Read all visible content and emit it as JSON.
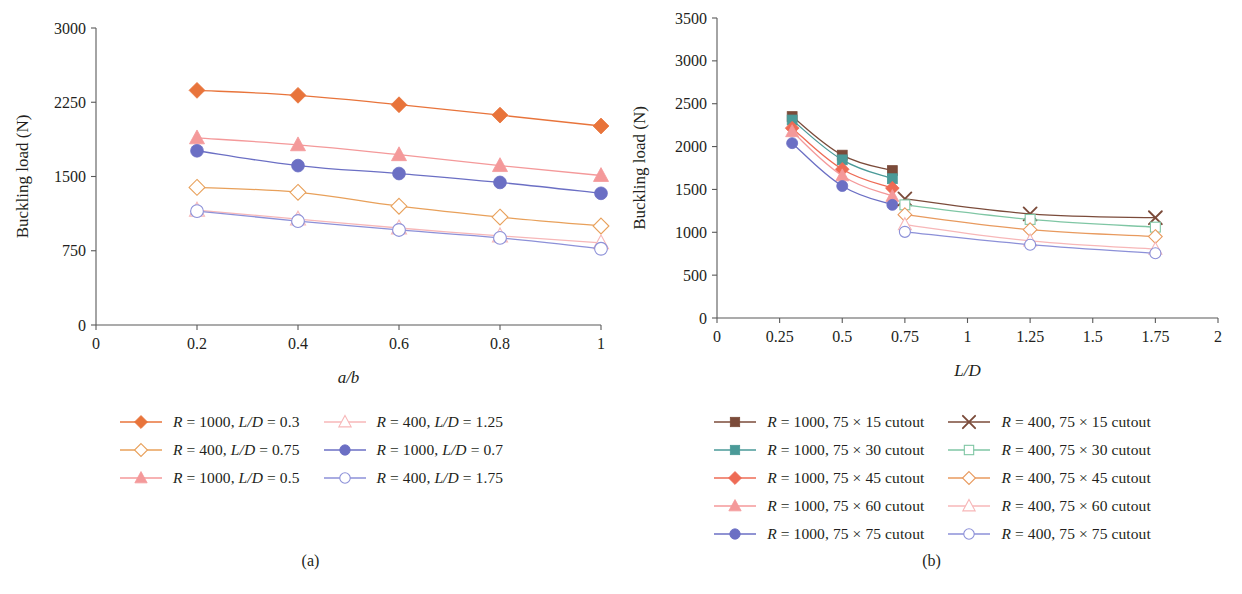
{
  "figure": {
    "panels": [
      {
        "id": "a",
        "caption": "(a)",
        "chart_data": {
          "type": "line",
          "title": "",
          "xlabel": "a/b",
          "ylabel": "Buckling load (N)",
          "xlim": [
            0,
            1
          ],
          "ylim": [
            0,
            3000
          ],
          "xticks": [
            "0",
            "0.2",
            "0.4",
            "0.6",
            "0.8",
            "1"
          ],
          "xtick_values": [
            0,
            0.2,
            0.4,
            0.6,
            0.8,
            1
          ],
          "yticks": [
            "0",
            "750",
            "1500",
            "2250",
            "3000"
          ],
          "ytick_values": [
            0,
            750,
            1500,
            2250,
            3000
          ],
          "grid": false,
          "legend_position": "below",
          "x": [
            0.2,
            0.4,
            0.6,
            0.8,
            1.0
          ],
          "series": [
            {
              "name": "R = 1000, L/D = 0.3",
              "label_html": "<i>R</i> = 1000, <i>L/D</i> = 0.3",
              "values": [
                2370,
                2320,
                2225,
                2120,
                2010
              ],
              "color": "#E8743B",
              "marker": "diamond",
              "filled": true
            },
            {
              "name": "R = 400, L/D = 0.75",
              "label_html": "<i>R</i> = 400, <i>L/D</i> = 0.75",
              "values": [
                1390,
                1340,
                1200,
                1090,
                1000
              ],
              "color": "#E8A05A",
              "marker": "diamond",
              "filled": false
            },
            {
              "name": "R = 1000, L/D = 0.5",
              "label_html": "<i>R</i> = 1000, <i>L/D</i> = 0.5",
              "values": [
                1890,
                1820,
                1720,
                1610,
                1510
              ],
              "color": "#F4999A",
              "marker": "triangle",
              "filled": true
            },
            {
              "name": "R = 400, L/D = 1.25",
              "label_html": "<i>R</i> = 400, <i>L/D</i> = 1.25",
              "values": [
                1160,
                1070,
                980,
                900,
                830
              ],
              "color": "#F7B7B8",
              "marker": "triangle",
              "filled": false
            },
            {
              "name": "R = 1000, L/D = 0.7",
              "label_html": "<i>R</i> = 1000, <i>L/D</i> = 0.7",
              "values": [
                1760,
                1610,
                1530,
                1440,
                1330
              ],
              "color": "#6B6FC4",
              "marker": "circle",
              "filled": true
            },
            {
              "name": "R = 400, L/D = 1.75",
              "label_html": "<i>R</i> = 400, <i>L/D</i> = 1.75",
              "values": [
                1150,
                1050,
                960,
                880,
                770
              ],
              "color": "#8C90D8",
              "marker": "circle",
              "filled": false
            }
          ],
          "legend_columns": [
            [
              "R = 1000, L/D = 0.3",
              "R = 400, L/D = 0.75",
              "R = 1000, L/D = 0.5"
            ],
            [
              "R = 400, L/D = 1.25",
              "R = 1000, L/D = 0.7",
              "R = 400, L/D = 1.75"
            ]
          ]
        }
      },
      {
        "id": "b",
        "caption": "(b)",
        "chart_data": {
          "type": "line",
          "title": "",
          "xlabel": "L/D",
          "ylabel": "Buckling load (N)",
          "xlim": [
            0,
            2
          ],
          "ylim": [
            0,
            3500
          ],
          "xticks": [
            "0",
            "0.25",
            "0.5",
            "0.75",
            "1",
            "1.25",
            "1.5",
            "1.75",
            "2"
          ],
          "xtick_values": [
            0,
            0.25,
            0.5,
            0.75,
            1,
            1.25,
            1.5,
            1.75,
            2
          ],
          "yticks": [
            "0",
            "500",
            "1000",
            "1500",
            "2000",
            "2500",
            "3000",
            "3500"
          ],
          "ytick_values": [
            0,
            500,
            1000,
            1500,
            2000,
            2500,
            3000,
            3500
          ],
          "grid": false,
          "legend_position": "below",
          "x_r1000": [
            0.3,
            0.5,
            0.7
          ],
          "x_r400": [
            0.75,
            1.25,
            1.75
          ],
          "series": [
            {
              "name": "R = 1000, 75 × 15 cutout",
              "label_html": "<i>R</i> = 1000, 75 &#215; 15 cutout",
              "x": [
                0.3,
                0.5,
                0.7
              ],
              "values": [
                2350,
                1900,
                1720
              ],
              "color": "#7B4B3A",
              "marker": "square",
              "filled": true
            },
            {
              "name": "R = 1000, 75 × 30 cutout",
              "label_html": "<i>R</i> = 1000, 75 &#215; 30 cutout",
              "x": [
                0.3,
                0.5,
                0.7
              ],
              "values": [
                2310,
                1845,
                1625
              ],
              "color": "#4A9A98",
              "marker": "square",
              "filled": true
            },
            {
              "name": "R = 1000, 75 × 45 cutout",
              "label_html": "<i>R</i> = 1000, 75 &#215; 45 cutout",
              "x": [
                0.3,
                0.5,
                0.7
              ],
              "values": [
                2215,
                1735,
                1515
              ],
              "color": "#EE6B55",
              "marker": "diamond",
              "filled": true
            },
            {
              "name": "R = 1000, 75 × 60 cutout",
              "label_html": "<i>R</i> = 1000, 75 &#215; 60 cutout",
              "x": [
                0.3,
                0.5,
                0.7
              ],
              "values": [
                2175,
                1660,
                1420
              ],
              "color": "#F4999A",
              "marker": "triangle",
              "filled": true
            },
            {
              "name": "R = 1000, 75 × 75 cutout",
              "label_html": "<i>R</i> = 1000, 75 &#215; 75 cutout",
              "x": [
                0.3,
                0.5,
                0.7
              ],
              "values": [
                2040,
                1540,
                1320
              ],
              "color": "#6B6FC4",
              "marker": "circle",
              "filled": true
            },
            {
              "name": "R = 400, 75 × 15 cutout",
              "label_html": "<i>R</i> = 400, 75 &#215; 15 cutout",
              "x": [
                0.75,
                1.25,
                1.75
              ],
              "values": [
                1390,
                1215,
                1170
              ],
              "color": "#7B4B3A",
              "marker": "x",
              "filled": false
            },
            {
              "name": "R = 400, 75 × 30 cutout",
              "label_html": "<i>R</i> = 400, 75 &#215; 30 cutout",
              "x": [
                0.75,
                1.25,
                1.75
              ],
              "values": [
                1320,
                1150,
                1060
              ],
              "color": "#7FC6A4",
              "marker": "square",
              "filled": false
            },
            {
              "name": "R = 400, 75 × 45 cutout",
              "label_html": "<i>R</i> = 400, 75 &#215; 45 cutout",
              "x": [
                0.75,
                1.25,
                1.75
              ],
              "values": [
                1205,
                1030,
                950
              ],
              "color": "#E89A5E",
              "marker": "diamond",
              "filled": false
            },
            {
              "name": "R = 400, 75 × 60 cutout",
              "label_html": "<i>R</i> = 400, 75 &#215; 60 cutout",
              "x": [
                0.75,
                1.25,
                1.75
              ],
              "values": [
                1090,
                900,
                805
              ],
              "color": "#F7B7B8",
              "marker": "triangle",
              "filled": false
            },
            {
              "name": "R = 400, 75 × 75 cutout",
              "label_html": "<i>R</i> = 400, 75 &#215; 75 cutout",
              "x": [
                0.75,
                1.25,
                1.75
              ],
              "values": [
                1005,
                855,
                755
              ],
              "color": "#8C90D8",
              "marker": "circle",
              "filled": false
            }
          ],
          "legend_columns": [
            [
              "R = 1000, 75 × 15 cutout",
              "R = 1000, 75 × 30 cutout",
              "R = 1000, 75 × 45 cutout",
              "R = 1000, 75 × 60 cutout",
              "R = 1000, 75 × 75 cutout"
            ],
            [
              "R = 400, 75 × 15 cutout",
              "R = 400, 75 × 30 cutout",
              "R = 400, 75 × 45 cutout",
              "R = 400, 75 × 60 cutout",
              "R = 400, 75 × 75 cutout"
            ]
          ]
        }
      }
    ]
  }
}
